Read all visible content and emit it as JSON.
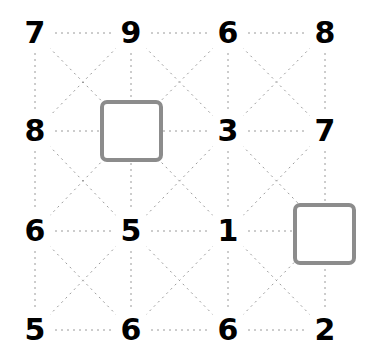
{
  "board": {
    "width": 371,
    "height": 359,
    "background_color": "#ffffff",
    "grid_rows": 4,
    "grid_cols": 4,
    "column_x": [
      35,
      131,
      228,
      325
    ],
    "row_y": [
      33,
      131,
      231,
      330
    ]
  },
  "style": {
    "line_color": "#9a9a9a",
    "line_dash": "2 4",
    "line_width": 1,
    "label_color": "#000000",
    "square_border_color": "#8c8c8c",
    "square_fill_color": "#ffffff"
  },
  "nodes": [
    {
      "id": "r1c1",
      "row": 0,
      "col": 0,
      "type": "number",
      "label": "7"
    },
    {
      "id": "r1c2",
      "row": 0,
      "col": 1,
      "type": "number",
      "label": "9"
    },
    {
      "id": "r1c3",
      "row": 0,
      "col": 2,
      "type": "number",
      "label": "6"
    },
    {
      "id": "r1c4",
      "row": 0,
      "col": 3,
      "type": "number",
      "label": "8"
    },
    {
      "id": "r2c1",
      "row": 1,
      "col": 0,
      "type": "number",
      "label": "8"
    },
    {
      "id": "r2c2",
      "row": 1,
      "col": 1,
      "type": "square",
      "label": ""
    },
    {
      "id": "r2c3",
      "row": 1,
      "col": 2,
      "type": "number",
      "label": "3"
    },
    {
      "id": "r2c4",
      "row": 1,
      "col": 3,
      "type": "number",
      "label": "7"
    },
    {
      "id": "r3c1",
      "row": 2,
      "col": 0,
      "type": "number",
      "label": "6"
    },
    {
      "id": "r3c2",
      "row": 2,
      "col": 1,
      "type": "number",
      "label": "5"
    },
    {
      "id": "r3c3",
      "row": 2,
      "col": 2,
      "type": "number",
      "label": "1"
    },
    {
      "id": "r3c4",
      "row": 2,
      "col": 3,
      "type": "square",
      "label": ""
    },
    {
      "id": "r4c1",
      "row": 3,
      "col": 0,
      "type": "number",
      "label": "5"
    },
    {
      "id": "r4c2",
      "row": 3,
      "col": 1,
      "type": "number",
      "label": "6"
    },
    {
      "id": "r4c3",
      "row": 3,
      "col": 2,
      "type": "number",
      "label": "6"
    },
    {
      "id": "r4c4",
      "row": 3,
      "col": 3,
      "type": "number",
      "label": "2"
    }
  ],
  "squares": [
    {
      "id": "square-r2c2",
      "row": 1,
      "col": 1,
      "x": 100,
      "y": 100,
      "width": 63,
      "height": 62
    },
    {
      "id": "square-r3c4",
      "row": 2,
      "col": 3,
      "x": 293,
      "y": 203,
      "width": 63,
      "height": 62
    }
  ],
  "edges": {
    "horizontal": true,
    "vertical": true,
    "diagonals": true,
    "label_gap": 20
  }
}
